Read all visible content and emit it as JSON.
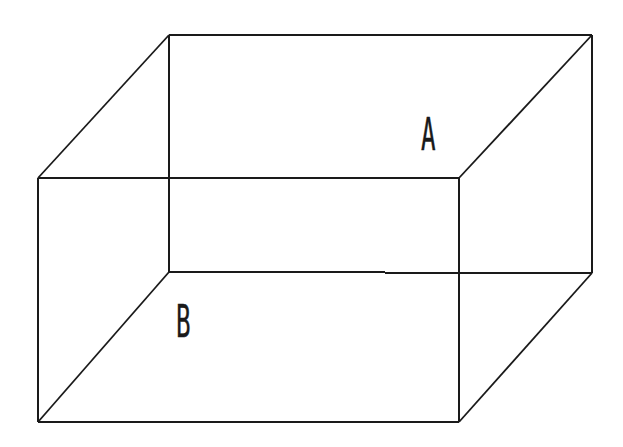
{
  "diagram": {
    "type": "wireframe-cuboid",
    "background": "#ffffff",
    "line_color": "#1a1a1a",
    "vertices": {
      "front_top_left": [
        38,
        178
      ],
      "front_top_right": [
        459,
        178
      ],
      "front_bottom_left": [
        38,
        422
      ],
      "front_bottom_right": [
        459,
        422
      ],
      "back_top_left": [
        169,
        35
      ],
      "back_top_right": [
        592,
        35
      ],
      "back_bottom_left": [
        169,
        272
      ],
      "back_bottom_right": [
        592,
        273
      ]
    },
    "labels": [
      {
        "text": "A",
        "x": 421,
        "y": 113,
        "size": 44
      },
      {
        "text": "B",
        "x": 176,
        "y": 300,
        "size": 44
      }
    ]
  }
}
